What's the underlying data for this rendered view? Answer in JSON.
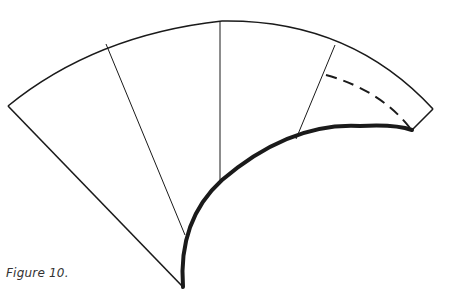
{
  "figure": {
    "caption": "Figure 10.",
    "colors": {
      "stroke": "#1a1a1a",
      "background": "#ffffff"
    },
    "shape": "curved-fan-pattern-with-three-dividers",
    "elements": [
      "outer-arc",
      "left-edge",
      "right-edge",
      "inner-curve-thick",
      "divider-1",
      "divider-2",
      "divider-3",
      "dashed-line"
    ]
  }
}
